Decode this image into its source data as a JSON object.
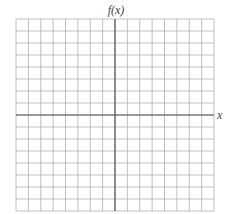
{
  "chart_data": {
    "type": "line",
    "title": "",
    "xlabel": "x",
    "ylabel": "f(x)",
    "grid": true,
    "columns": 16,
    "rows": 16,
    "x_axis_position": "center",
    "y_axis_position": "center",
    "series": [],
    "tick_labels": {
      "x": [],
      "y": []
    }
  },
  "labels": {
    "y_axis": "f(x)",
    "x_axis": "x"
  },
  "colors": {
    "grid": "#b0b0b0",
    "axis": "#555555",
    "background": "#ffffff"
  }
}
